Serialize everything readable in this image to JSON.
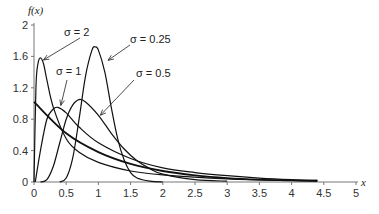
{
  "chart_data": {
    "type": "line",
    "title": "",
    "xlabel": "x",
    "ylabel": "f(x)",
    "xlim": [
      0,
      5
    ],
    "ylim": [
      0,
      2
    ],
    "x_ticks": [
      "0",
      "0.5",
      "1",
      "1.5",
      "2",
      "2.5",
      "3",
      "3.5",
      "4",
      "4.5",
      "5"
    ],
    "y_ticks": [
      "0",
      "0.4",
      "0.8",
      "1.2",
      "1.6",
      "2"
    ],
    "grid": false,
    "legend": "annotations with arrows",
    "series": [
      {
        "name": "σ = 0.25",
        "x": [
          0.4,
          0.5,
          0.6,
          0.7,
          0.8,
          0.9,
          0.95,
          1.0,
          1.1,
          1.2,
          1.3,
          1.4,
          1.5,
          1.6,
          1.8,
          2.0
        ],
        "values": [
          0.0,
          0.05,
          0.3,
          0.8,
          1.35,
          1.68,
          1.72,
          1.68,
          1.4,
          0.95,
          0.55,
          0.28,
          0.12,
          0.05,
          0.01,
          0.0
        ]
      },
      {
        "name": "σ = 0.5",
        "x": [
          0.1,
          0.2,
          0.3,
          0.4,
          0.5,
          0.6,
          0.7,
          0.8,
          1.0,
          1.2,
          1.4,
          1.6,
          1.8,
          2.0,
          2.5,
          3.0
        ],
        "values": [
          0.0,
          0.03,
          0.2,
          0.5,
          0.8,
          0.98,
          1.05,
          1.02,
          0.85,
          0.62,
          0.42,
          0.27,
          0.17,
          0.1,
          0.03,
          0.01
        ]
      },
      {
        "name": "σ = 1",
        "x": [
          0.02,
          0.1,
          0.2,
          0.3,
          0.37,
          0.5,
          0.7,
          1.0,
          1.5,
          2.0,
          2.5,
          3.0,
          3.5,
          4.0,
          4.4
        ],
        "values": [
          0.0,
          0.4,
          0.8,
          0.93,
          0.95,
          0.88,
          0.7,
          0.5,
          0.3,
          0.18,
          0.12,
          0.08,
          0.05,
          0.03,
          0.02
        ]
      },
      {
        "name": "σ = 2",
        "x": [
          0.0,
          0.03,
          0.06,
          0.1,
          0.15,
          0.2,
          0.3,
          0.5,
          0.7,
          1.0,
          1.5,
          2.0,
          3.0,
          4.0,
          4.4
        ],
        "values": [
          0.0,
          1.2,
          1.5,
          1.58,
          1.5,
          1.3,
          0.95,
          0.55,
          0.38,
          0.25,
          0.14,
          0.09,
          0.04,
          0.02,
          0.02
        ]
      },
      {
        "name": "exponential (unlabeled)",
        "x": [
          0.0,
          0.5,
          1.0,
          1.5,
          2.0,
          2.5,
          3.0,
          3.5,
          4.0,
          4.4
        ],
        "values": [
          1.02,
          0.62,
          0.38,
          0.23,
          0.14,
          0.085,
          0.05,
          0.03,
          0.02,
          0.01
        ]
      }
    ],
    "annotations": [
      {
        "text": "σ = 2",
        "points_to": [
          0.1,
          1.58
        ]
      },
      {
        "text": "σ = 1",
        "points_to": [
          0.37,
          0.95
        ]
      },
      {
        "text": "σ = 0.25",
        "points_to": [
          1.15,
          1.55
        ]
      },
      {
        "text": "σ = 0.5",
        "points_to": [
          1.0,
          0.85
        ]
      }
    ]
  },
  "labels": {
    "ylabel": "f(x)",
    "xlabel": "x",
    "ann_s2": "σ = 2",
    "ann_s1": "σ = 1",
    "ann_s025": "σ = 0.25",
    "ann_s05": "σ = 0.5"
  }
}
